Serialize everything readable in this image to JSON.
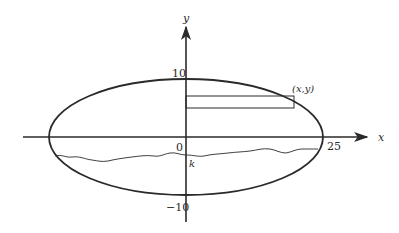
{
  "diagram": {
    "type": "ellipse-cross-section",
    "axes": {
      "x_label": "x",
      "y_label": "y",
      "origin_label": "0"
    },
    "ticks": {
      "y_top": "10",
      "y_bottom": "−10",
      "x_right": "25"
    },
    "point_label": "(x,y)",
    "level_label": "k",
    "colors": {
      "stroke": "#2a2a2a",
      "background": "#ffffff"
    }
  }
}
